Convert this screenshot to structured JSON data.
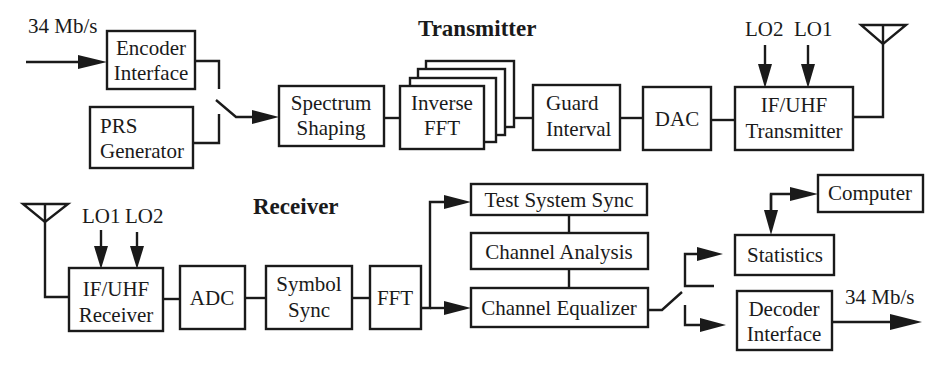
{
  "sections": {
    "transmitter": {
      "title": "Transmitter"
    },
    "receiver": {
      "title": "Receiver"
    }
  },
  "transmitter": {
    "input_rate": "34 Mb/s",
    "blocks": {
      "encoder_interface": [
        "Encoder",
        "Interface"
      ],
      "prs_generator": [
        "PRS",
        "Generator"
      ],
      "spectrum_shaping": [
        "Spectrum",
        "Shaping"
      ],
      "inverse_fft": [
        "Inverse",
        "FFT"
      ],
      "guard_interval": [
        "Guard",
        "Interval"
      ],
      "dac": [
        "DAC"
      ],
      "if_uhf_transmitter": [
        "IF/UHF",
        "Transmitter"
      ]
    },
    "lo_labels": [
      "LO2",
      "LO1"
    ]
  },
  "receiver": {
    "lo_labels": [
      "LO1",
      "LO2"
    ],
    "blocks": {
      "if_uhf_receiver": [
        "IF/UHF",
        "Receiver"
      ],
      "adc": [
        "ADC"
      ],
      "symbol_sync": [
        "Symbol",
        "Sync"
      ],
      "fft": [
        "FFT"
      ],
      "test_system_sync": [
        "Test System Sync"
      ],
      "channel_analysis": [
        "Channel Analysis"
      ],
      "channel_equalizer": [
        "Channel Equalizer"
      ],
      "computer": [
        "Computer"
      ],
      "statistics": [
        "Statistics"
      ],
      "decoder_interface": [
        "Decoder",
        "Interface"
      ]
    },
    "output_rate": "34 Mb/s"
  },
  "colors": {
    "ink": "#1a1a1a",
    "background": "#ffffff"
  }
}
